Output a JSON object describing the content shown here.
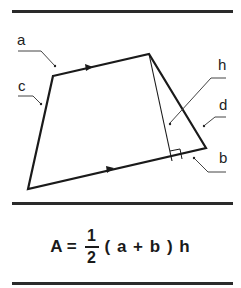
{
  "labels": {
    "a": "a",
    "b": "b",
    "c": "c",
    "d": "d",
    "h": "h"
  },
  "formula": {
    "lhs": "A",
    "equals": "=",
    "numerator": "1",
    "denominator": "2",
    "rest": "( a + b ) h"
  },
  "colors": {
    "line": "#1a1a1a",
    "rule": "#2a2a2a",
    "leader": "#444444"
  },
  "shape": {
    "vertices": [
      [
        53,
        76
      ],
      [
        149,
        54
      ],
      [
        206,
        148
      ],
      [
        28,
        189
      ]
    ],
    "height_foot": [
      172,
      160
    ],
    "right_angle_size": 10
  }
}
